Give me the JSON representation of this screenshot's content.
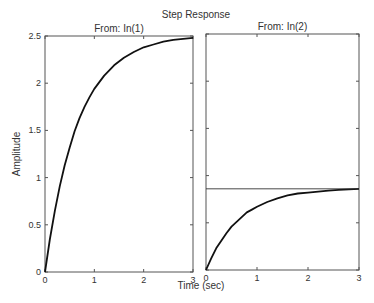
{
  "title": "Step Response",
  "xlabel": "Time (sec)",
  "ylabel": "Amplitude",
  "chart_data": [
    {
      "type": "line",
      "title": "From: In(1)",
      "xlabel": "Time (sec)",
      "ylabel": "Amplitude",
      "xlim": [
        0,
        3
      ],
      "ylim": [
        0,
        2.5
      ],
      "xticks": [
        "0",
        "1",
        "2",
        "3"
      ],
      "yticks": [
        "0",
        "0.5",
        "1",
        "1.5",
        "2",
        "2.5"
      ],
      "grid": false,
      "series": [
        {
          "name": "step response",
          "x": [
            0,
            0.1,
            0.2,
            0.3,
            0.4,
            0.5,
            0.6,
            0.7,
            0.8,
            0.9,
            1.0,
            1.2,
            1.4,
            1.6,
            1.8,
            2.0,
            2.2,
            2.4,
            2.6,
            2.8,
            3.0
          ],
          "values": [
            0,
            0.35,
            0.65,
            0.91,
            1.13,
            1.32,
            1.49,
            1.63,
            1.75,
            1.85,
            1.94,
            2.08,
            2.19,
            2.27,
            2.33,
            2.38,
            2.41,
            2.44,
            2.46,
            2.47,
            2.48
          ]
        }
      ]
    },
    {
      "type": "line",
      "title": "From: In(2)",
      "xlabel": "Time (sec)",
      "xlim": [
        0,
        3
      ],
      "ylim": [
        0,
        2.5
      ],
      "xticks": [
        "0",
        "1",
        "2",
        "3"
      ],
      "grid": false,
      "series": [
        {
          "name": "step response",
          "x": [
            0,
            0.1,
            0.2,
            0.3,
            0.4,
            0.5,
            0.6,
            0.7,
            0.8,
            0.9,
            1.0,
            1.2,
            1.4,
            1.6,
            1.8,
            2.0,
            2.2,
            2.4,
            2.6,
            2.8,
            3.0
          ],
          "values": [
            0,
            0.12,
            0.23,
            0.31,
            0.39,
            0.46,
            0.51,
            0.56,
            0.61,
            0.64,
            0.67,
            0.72,
            0.76,
            0.79,
            0.81,
            0.82,
            0.83,
            0.84,
            0.85,
            0.855,
            0.86
          ]
        },
        {
          "name": "steady-state",
          "x": [
            0,
            3
          ],
          "values": [
            0.86,
            0.86
          ]
        }
      ]
    }
  ]
}
